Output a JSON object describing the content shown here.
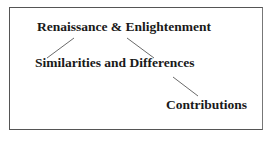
{
  "diagram": {
    "nodes": [
      {
        "id": "renaissance",
        "label": "Renaissance & Enlightenment"
      },
      {
        "id": "similarities",
        "label": "Similarities and Differences"
      },
      {
        "id": "contributions",
        "label": "Contributions"
      }
    ],
    "edges": [
      {
        "from": "renaissance",
        "to": "similarities"
      },
      {
        "from": "renaissance",
        "to": "similarities"
      },
      {
        "from": "similarities",
        "to": "contributions"
      }
    ]
  }
}
